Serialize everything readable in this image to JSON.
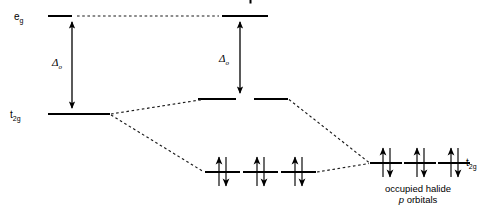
{
  "figure": {
    "type": "molecular-orbital-energy-level-diagram",
    "background": "#ffffff",
    "ink": "#000000",
    "labels": {
      "eg": "e",
      "eg_sub": "g",
      "t2g_left": "t",
      "t2g_left_sub": "2g",
      "t2g_right": "t",
      "t2g_right_sub": "2g",
      "delta_left": "Δ",
      "delta_left_sub": "o",
      "delta_right": "Δ",
      "delta_right_sub": "o",
      "caption_line1": "occupied halide",
      "caption_line2_italic": "p",
      "caption_line2_rest": " orbitals"
    },
    "levels": {
      "eg_left": {
        "x1": 48,
        "x2": 72,
        "y": 16
      },
      "eg_right": {
        "x1": 222,
        "x2": 268,
        "y": 16
      },
      "eg_dotted": {
        "x1": 76,
        "x2": 219,
        "y": 16
      },
      "t2g_left": {
        "x1": 48,
        "x2": 110,
        "y": 114
      },
      "t2g_mid_upper_a": {
        "x1": 198,
        "x2": 236,
        "y": 99
      },
      "t2g_mid_upper_b": {
        "x1": 254,
        "x2": 288,
        "y": 99
      },
      "bonding_mid": [
        {
          "x1": 205,
          "x2": 240,
          "y": 172
        },
        {
          "x1": 243,
          "x2": 278,
          "y": 172
        },
        {
          "x1": 281,
          "x2": 316,
          "y": 172
        }
      ],
      "halide_right": [
        {
          "x1": 370,
          "x2": 402,
          "y": 163
        },
        {
          "x1": 404,
          "x2": 436,
          "y": 163
        },
        {
          "x1": 438,
          "x2": 470,
          "y": 163
        }
      ]
    },
    "arrows": {
      "delta_left_arrow": {
        "x": 72,
        "y_top": 16,
        "y_bottom": 114
      },
      "delta_right_arrow": {
        "x": 240,
        "y_top": 16,
        "y_bottom": 99
      }
    },
    "correlation_lines": [
      {
        "from_x": 110,
        "from_y": 114,
        "to_x": 204,
        "to_y": 99
      },
      {
        "from_x": 110,
        "from_y": 114,
        "to_x": 205,
        "to_y": 172
      },
      {
        "from_x": 288,
        "from_y": 99,
        "to_x": 370,
        "to_y": 163
      },
      {
        "from_x": 316,
        "from_y": 172,
        "to_x": 370,
        "to_y": 163
      }
    ],
    "electron_pairs": {
      "middle_count": 3,
      "right_count": 3,
      "spin": "paired-up-down"
    }
  }
}
